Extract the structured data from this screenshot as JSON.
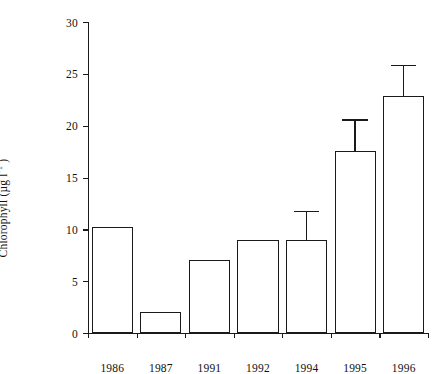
{
  "chart_data": {
    "type": "bar",
    "title": "",
    "xlabel": "",
    "ylabel": "Chlorophyll (µg l",
    "ylabel_exponent": "-1",
    "ylabel_suffix": " )",
    "categories": [
      "1986",
      "1987",
      "1991",
      "1992",
      "1994",
      "1995",
      "1996"
    ],
    "values": [
      10.2,
      2.0,
      7.0,
      9.0,
      9.0,
      17.6,
      22.9
    ],
    "errors": [
      null,
      null,
      null,
      null,
      2.8,
      3.0,
      3.0
    ],
    "error_upper": [
      null,
      null,
      null,
      null,
      11.8,
      20.6,
      25.9
    ],
    "ylim": [
      0,
      30
    ],
    "yticks": [
      "0",
      "5",
      "10",
      "15",
      "20",
      "25",
      "30"
    ],
    "ytick_values": [
      0,
      5,
      10,
      15,
      20,
      25,
      30
    ],
    "grid": false,
    "legend": false,
    "bar_fill": "#ffffff",
    "bar_edge": "#1a1a1a",
    "axis_color": "#1a1a1a",
    "background": "#ffffff"
  }
}
